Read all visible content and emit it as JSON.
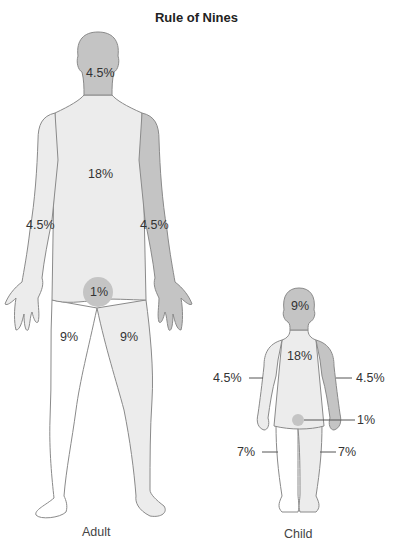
{
  "title": "Rule of Nines",
  "colors": {
    "dark_region": "#c4c4c4",
    "light_region": "#ececec",
    "white_region": "#ffffff",
    "outline": "#8a8a8a",
    "text": "#333333"
  },
  "adult": {
    "caption": "Adult",
    "labels": {
      "head": "4.5%",
      "trunk": "18%",
      "left_arm": "4.5%",
      "right_arm": "4.5%",
      "genitalia": "1%",
      "left_leg": "9%",
      "right_leg": "9%"
    }
  },
  "child": {
    "caption": "Child",
    "labels": {
      "head": "9%",
      "trunk": "18%",
      "left_arm": "4.5%",
      "right_arm": "4.5%",
      "genitalia": "1%",
      "left_leg": "7%",
      "right_leg": "7%"
    }
  }
}
